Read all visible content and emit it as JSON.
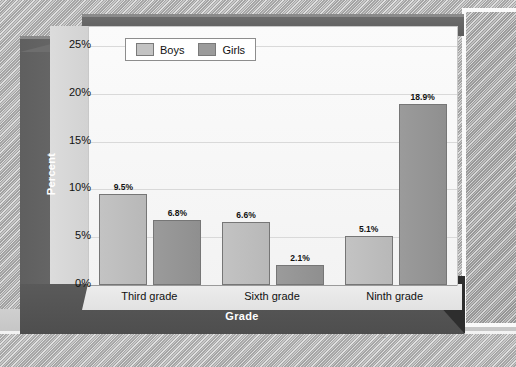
{
  "figure": {
    "background_texture": "halftone-gray",
    "frame_color": "#5a5a5a",
    "panel_color": "#fbfbfb",
    "speck_mark": "~"
  },
  "legend": {
    "position": "top-left-inside",
    "items": [
      {
        "label": "Boys",
        "color": "#c3c3c3",
        "swatch_name": "legend-swatch-boys"
      },
      {
        "label": "Girls",
        "color": "#9b9b9b",
        "swatch_name": "legend-swatch-girls"
      }
    ]
  },
  "chart_data": {
    "type": "bar",
    "title": "",
    "subtitle": "",
    "xlabel": "Grade",
    "ylabel": "Percent",
    "categories": [
      "Third grade",
      "Sixth grade",
      "Ninth grade"
    ],
    "series": [
      {
        "name": "Boys",
        "color": "#c3c3c3",
        "values": [
          9.5,
          6.6,
          5.1
        ],
        "labels": [
          "9.5%",
          "6.6%",
          "5.1%"
        ]
      },
      {
        "name": "Girls",
        "color": "#9b9b9b",
        "values": [
          6.8,
          2.1,
          18.9
        ],
        "labels": [
          "6.8%",
          "2.1%",
          "18.9%"
        ]
      }
    ],
    "ylim": [
      0,
      27
    ],
    "yticks": [
      0,
      5,
      10,
      15,
      20,
      25
    ],
    "ytick_labels": [
      "0%",
      "5%",
      "10%",
      "15%",
      "20%",
      "25%"
    ],
    "grid": true,
    "grid_axis": "y",
    "legend_position": "upper left",
    "value_labels": true,
    "units": "percent"
  }
}
